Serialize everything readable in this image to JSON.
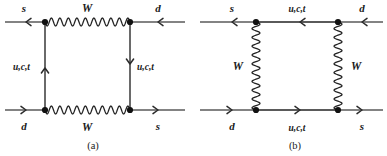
{
  "figure": {
    "type": "feynman-box-diagrams",
    "colors": {
      "line": "#5a5a5a",
      "wave": "#222222",
      "vertex": "#111111",
      "text": "#1a1a1a",
      "background": "#ffffff"
    },
    "panels": [
      {
        "id": "a",
        "caption": "(a)",
        "caption_x": 93,
        "caption_y": 149,
        "boxes": {
          "left_x": 45,
          "right_x": 130,
          "top_y": 22,
          "bottom_y": 110
        },
        "external_lines": [
          {
            "name": "top-left-incoming",
            "label": "s",
            "label_x": 24,
            "label_y": 12,
            "x1": 5,
            "y1": 22,
            "x2": 45,
            "y2": 22,
            "arrow_dir": "left",
            "arrow_x": 26,
            "arrow_y": 22
          },
          {
            "name": "top-right-incoming",
            "label": "d",
            "label_x": 158,
            "label_y": 12,
            "x1": 130,
            "y1": 22,
            "x2": 185,
            "y2": 22,
            "arrow_dir": "left",
            "arrow_x": 158,
            "arrow_y": 22
          },
          {
            "name": "bottom-left-outgoing",
            "label": "d",
            "label_x": 24,
            "label_y": 130,
            "x1": 5,
            "y1": 110,
            "x2": 45,
            "y2": 110,
            "arrow_dir": "right",
            "arrow_x": 26,
            "arrow_y": 110
          },
          {
            "name": "bottom-right-outgoing",
            "label": "s",
            "label_x": 158,
            "label_y": 130,
            "x1": 130,
            "y1": 110,
            "x2": 185,
            "y2": 110,
            "arrow_dir": "right",
            "arrow_x": 158,
            "arrow_y": 110
          }
        ],
        "wavy_propagators": [
          {
            "name": "w-boson-top",
            "label": "W",
            "label_x": 87,
            "label_y": 12,
            "orientation": "horizontal",
            "x1": 45,
            "y1": 22,
            "x2": 130,
            "y2": 22,
            "cycles": 10,
            "amplitude": 4.0
          },
          {
            "name": "w-boson-bottom",
            "label": "W",
            "label_x": 87,
            "label_y": 131,
            "orientation": "horizontal",
            "x1": 45,
            "y1": 110,
            "x2": 130,
            "y2": 110,
            "cycles": 10,
            "amplitude": 4.0
          }
        ],
        "internal_lines": [
          {
            "name": "quark-propagator-left",
            "label": "u,c,t",
            "label_x": 13,
            "label_y": 70,
            "label_anchor": "start",
            "orientation": "vertical",
            "x1": 45,
            "y1": 22,
            "x2": 45,
            "y2": 110,
            "arrow_dir": "up",
            "arrow_x": 45,
            "arrow_y": 68
          },
          {
            "name": "quark-propagator-right",
            "label": "u,c,t",
            "label_x": 137,
            "label_y": 70,
            "label_anchor": "start",
            "orientation": "vertical",
            "x1": 130,
            "y1": 22,
            "x2": 130,
            "y2": 110,
            "arrow_dir": "down",
            "arrow_x": 130,
            "arrow_y": 64
          }
        ],
        "vertices": [
          {
            "name": "vertex-top-left",
            "x": 45,
            "y": 22
          },
          {
            "name": "vertex-top-right",
            "x": 130,
            "y": 22
          },
          {
            "name": "vertex-bottom-left",
            "x": 45,
            "y": 110
          },
          {
            "name": "vertex-bottom-right",
            "x": 130,
            "y": 110
          }
        ]
      },
      {
        "id": "b",
        "caption": "(b)",
        "caption_x": 295,
        "caption_y": 149,
        "boxes": {
          "left_x": 256,
          "right_x": 338,
          "top_y": 22,
          "bottom_y": 110
        },
        "external_lines": [
          {
            "name": "top-left-incoming",
            "label": "s",
            "label_x": 232,
            "label_y": 12,
            "x1": 200,
            "y1": 22,
            "x2": 256,
            "y2": 22,
            "arrow_dir": "left",
            "arrow_x": 232,
            "arrow_y": 22
          },
          {
            "name": "top-right-incoming",
            "label": "d",
            "label_x": 362,
            "label_y": 12,
            "x1": 338,
            "y1": 22,
            "x2": 383,
            "y2": 22,
            "arrow_dir": "left",
            "arrow_x": 362,
            "arrow_y": 22
          },
          {
            "name": "bottom-left-outgoing",
            "label": "d",
            "label_x": 232,
            "label_y": 130,
            "x1": 200,
            "y1": 110,
            "x2": 256,
            "y2": 110,
            "arrow_dir": "right",
            "arrow_x": 232,
            "arrow_y": 110
          },
          {
            "name": "bottom-right-outgoing",
            "label": "s",
            "label_x": 362,
            "label_y": 130,
            "x1": 338,
            "y1": 110,
            "x2": 383,
            "y2": 110,
            "arrow_dir": "right",
            "arrow_x": 362,
            "arrow_y": 110
          }
        ],
        "wavy_propagators": [
          {
            "name": "w-boson-left",
            "label": "W",
            "label_x": 243,
            "label_y": 70,
            "label_anchor": "end",
            "orientation": "vertical",
            "x1": 256,
            "y1": 22,
            "x2": 256,
            "y2": 110,
            "cycles": 10,
            "amplitude": 4.0
          },
          {
            "name": "w-boson-right",
            "label": "W",
            "label_x": 351,
            "label_y": 70,
            "label_anchor": "start",
            "orientation": "vertical",
            "x1": 338,
            "y1": 22,
            "x2": 338,
            "y2": 110,
            "cycles": 10,
            "amplitude": 4.0
          }
        ],
        "internal_lines": [
          {
            "name": "quark-propagator-top",
            "label": "u,c,t",
            "label_x": 297,
            "label_y": 12,
            "label_anchor": "middle",
            "orientation": "horizontal",
            "x1": 256,
            "y1": 22,
            "x2": 338,
            "y2": 22,
            "arrow_dir": "left",
            "arrow_x": 300,
            "arrow_y": 22
          },
          {
            "name": "quark-propagator-bottom",
            "label": "u,c,t",
            "label_x": 297,
            "label_y": 131,
            "label_anchor": "middle",
            "orientation": "horizontal",
            "x1": 256,
            "y1": 110,
            "x2": 338,
            "y2": 110,
            "arrow_dir": "right",
            "arrow_x": 300,
            "arrow_y": 110
          }
        ],
        "vertices": [
          {
            "name": "vertex-top-left",
            "x": 256,
            "y": 22
          },
          {
            "name": "vertex-top-right",
            "x": 338,
            "y": 22
          },
          {
            "name": "vertex-bottom-left",
            "x": 256,
            "y": 110
          },
          {
            "name": "vertex-bottom-right",
            "x": 338,
            "y": 110
          }
        ]
      }
    ]
  }
}
